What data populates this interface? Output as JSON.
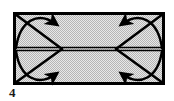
{
  "figure": {
    "kind": "origami-fold-diagram",
    "caption": "4",
    "shape": {
      "name": "rectangle",
      "x": 13,
      "y": 12,
      "width": 152,
      "height": 73,
      "fill_color": "#c9c9c9",
      "stroke_color": "#000000",
      "stroke_width": 3
    },
    "center_crease": {
      "label": "horizontal center crease",
      "y": 49,
      "style": "double-line",
      "color": "#000000"
    },
    "corner_creases": [
      {
        "corner": "top-left",
        "from_x": 13,
        "from_y": 12,
        "to_x": 60,
        "to_y": 49
      },
      {
        "corner": "top-right",
        "from_x": 165,
        "from_y": 12,
        "to_x": 118,
        "to_y": 49
      },
      {
        "corner": "bottom-left",
        "from_x": 13,
        "from_y": 85,
        "to_x": 60,
        "to_y": 49
      },
      {
        "corner": "bottom-right",
        "from_x": 165,
        "from_y": 85,
        "to_x": 118,
        "to_y": 49
      }
    ],
    "fold_arrows": [
      {
        "corner": "top-left",
        "direction": "down-right",
        "head_x": 53,
        "head_y": 45
      },
      {
        "corner": "top-right",
        "direction": "down-left",
        "head_x": 125,
        "head_y": 45
      },
      {
        "corner": "bottom-left",
        "direction": "up-right",
        "head_x": 53,
        "head_y": 54
      },
      {
        "corner": "bottom-right",
        "direction": "up-left",
        "head_x": 125,
        "head_y": 54
      }
    ],
    "colors": {
      "ink": "#000000",
      "paper": "#c9c9c9",
      "background": "#ffffff"
    }
  }
}
